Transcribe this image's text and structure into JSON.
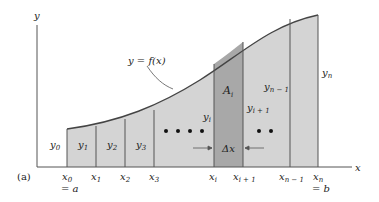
{
  "diagram": {
    "panel_label": "(a)",
    "axes": {
      "x_label": "x",
      "y_label": "y"
    },
    "curve_label": "y = f(x)",
    "area_label": "A",
    "area_sub": "i",
    "delta_label": "Δx",
    "colors": {
      "strip": "#d4d4d4",
      "highlight": "#a8a8a8",
      "line": "#555555",
      "curve": "#444444"
    },
    "y_labels": [
      {
        "base": "y",
        "sub": "0"
      },
      {
        "base": "y",
        "sub": "1"
      },
      {
        "base": "y",
        "sub": "2"
      },
      {
        "base": "y",
        "sub": "3"
      },
      {
        "base": "y",
        "sub": "i"
      },
      {
        "base": "y",
        "sub": "i + 1"
      },
      {
        "base": "y",
        "sub": "n − 1"
      },
      {
        "base": "y",
        "sub": "n"
      }
    ],
    "x_labels": [
      {
        "base": "x",
        "sub": "0",
        "extra": "= a"
      },
      {
        "base": "x",
        "sub": "1"
      },
      {
        "base": "x",
        "sub": "2"
      },
      {
        "base": "x",
        "sub": "3"
      },
      {
        "base": "x",
        "sub": "i"
      },
      {
        "base": "x",
        "sub": "i + 1"
      },
      {
        "base": "x",
        "sub": "n − 1"
      },
      {
        "base": "x",
        "sub": "n",
        "extra": "= b"
      }
    ],
    "ellipsis": "• • • •",
    "ellipsis2": "• •"
  }
}
